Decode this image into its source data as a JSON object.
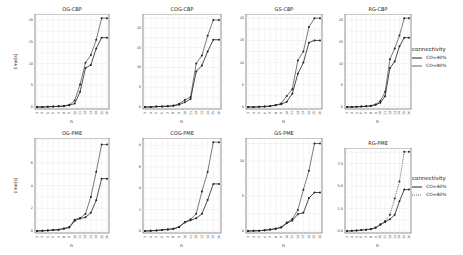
{
  "legend": {
    "title": "connectivity",
    "entries": [
      "CO=40%",
      "CO=80%"
    ]
  },
  "chart_data": [
    {
      "type": "line",
      "title": "OG-CBP",
      "xlabel": "n",
      "ylabel": "time(s)",
      "x": [
        3,
        4,
        5,
        6,
        7,
        8,
        9,
        10,
        11,
        12,
        13,
        14,
        15,
        16
      ],
      "ylim": [
        0,
        21
      ],
      "yticks": [
        0,
        5,
        10,
        15,
        20
      ],
      "grid": true,
      "series": [
        {
          "name": "CO=40%",
          "values": [
            0,
            0,
            0.05,
            0.1,
            0.15,
            0.2,
            0.4,
            0.8,
            3.5,
            9,
            9.7,
            13.5,
            16,
            16
          ]
        },
        {
          "name": "CO=80%",
          "values": [
            0,
            0,
            0.05,
            0.1,
            0.15,
            0.25,
            0.5,
            1.5,
            5.2,
            10.2,
            12,
            15.5,
            20.5,
            20.5
          ]
        }
      ]
    },
    {
      "type": "line",
      "title": "COG-CBP",
      "xlabel": "n",
      "ylabel": "",
      "x": [
        3,
        4,
        5,
        6,
        7,
        8,
        9,
        10,
        11,
        12,
        13,
        14,
        15,
        16
      ],
      "ylim": [
        0,
        23
      ],
      "yticks": [
        0,
        5,
        10,
        15,
        20
      ],
      "grid": true,
      "series": [
        {
          "name": "CO=40%",
          "values": [
            0,
            0,
            0.1,
            0.15,
            0.2,
            0.3,
            0.6,
            1.2,
            2,
            9,
            10.5,
            14,
            17,
            17
          ]
        },
        {
          "name": "CO=80%",
          "values": [
            0,
            0,
            0.1,
            0.15,
            0.2,
            0.35,
            0.8,
            1.8,
            2.5,
            11,
            13,
            18,
            22,
            22
          ]
        }
      ]
    },
    {
      "type": "line",
      "title": "GS-CBP",
      "xlabel": "n",
      "ylabel": "",
      "x": [
        3,
        4,
        5,
        6,
        7,
        8,
        9,
        10,
        11,
        12,
        13,
        14,
        15,
        16
      ],
      "ylim": [
        0,
        20.5
      ],
      "yticks": [
        0.0,
        5.0,
        10.0,
        15.0,
        20.0
      ],
      "grid": true,
      "series": [
        {
          "name": "CO=40%",
          "values": [
            0,
            0,
            0.05,
            0.1,
            0.2,
            0.4,
            0.6,
            1.2,
            3,
            7.5,
            10,
            14.5,
            15,
            15
          ]
        },
        {
          "name": "CO=80%",
          "values": [
            0,
            0,
            0.05,
            0.1,
            0.2,
            0.45,
            0.8,
            2.5,
            4,
            10.5,
            12.5,
            18,
            20,
            20
          ]
        }
      ]
    },
    {
      "type": "line",
      "title": "RG-CBP",
      "xlabel": "n",
      "ylabel": "",
      "x": [
        3,
        4,
        5,
        6,
        7,
        8,
        9,
        10,
        11,
        12,
        13,
        14,
        15,
        16
      ],
      "ylim": [
        0,
        21
      ],
      "yticks": [
        0,
        5,
        10,
        15,
        20
      ],
      "grid": true,
      "series": [
        {
          "name": "CO=40%",
          "values": [
            0,
            0,
            0.05,
            0.1,
            0.15,
            0.25,
            0.5,
            1,
            2.5,
            9,
            10.5,
            14,
            16,
            16
          ]
        },
        {
          "name": "CO=80%",
          "values": [
            0,
            0,
            0.05,
            0.1,
            0.15,
            0.3,
            0.6,
            1.4,
            3.5,
            11,
            13.5,
            16.5,
            20.5,
            20.5
          ]
        }
      ]
    },
    {
      "type": "line",
      "title": "OG-PME",
      "xlabel": "n",
      "ylabel": "time(s)",
      "x": [
        3,
        4,
        5,
        6,
        7,
        8,
        9,
        10,
        11,
        12,
        13,
        14,
        15,
        16
      ],
      "ylim": [
        0,
        8
      ],
      "yticks": [
        0,
        2,
        4,
        6
      ],
      "grid": true,
      "series": [
        {
          "name": "CO=40%",
          "values": [
            0,
            0.02,
            0.05,
            0.08,
            0.12,
            0.2,
            0.3,
            0.9,
            1.1,
            1.2,
            1.6,
            2.7,
            4.6,
            4.6
          ]
        },
        {
          "name": "CO=80%",
          "values": [
            0,
            0.02,
            0.05,
            0.08,
            0.12,
            0.22,
            0.35,
            1,
            1.15,
            1.5,
            3,
            5.2,
            7.6,
            7.6
          ]
        }
      ]
    },
    {
      "type": "line",
      "title": "COG-PME",
      "xlabel": "n",
      "ylabel": "",
      "x": [
        3,
        4,
        5,
        6,
        7,
        8,
        9,
        10,
        11,
        12,
        13,
        14,
        15,
        16
      ],
      "ylim": [
        0,
        8.5
      ],
      "yticks": [
        0,
        2,
        4,
        6,
        8
      ],
      "grid": true,
      "series": [
        {
          "name": "CO=40%",
          "values": [
            0,
            0.02,
            0.05,
            0.1,
            0.15,
            0.2,
            0.35,
            0.8,
            1,
            1.2,
            1.6,
            2.9,
            4.4,
            4.4
          ]
        },
        {
          "name": "CO=80%",
          "values": [
            0,
            0.02,
            0.05,
            0.1,
            0.15,
            0.22,
            0.4,
            0.85,
            1.1,
            1.6,
            3.7,
            5.5,
            8.3,
            8.3
          ]
        }
      ]
    },
    {
      "type": "line",
      "title": "GS-PME",
      "xlabel": "n",
      "ylabel": "",
      "x": [
        3,
        4,
        5,
        6,
        7,
        8,
        9,
        10,
        11,
        12,
        13,
        14,
        15,
        16
      ],
      "ylim": [
        0,
        13
      ],
      "yticks": [
        0,
        5,
        10
      ],
      "grid": true,
      "series": [
        {
          "name": "CO=40%",
          "values": [
            0,
            0.02,
            0.05,
            0.1,
            0.2,
            0.3,
            0.5,
            1.1,
            1.5,
            2.4,
            2.6,
            4.7,
            5.5,
            5.5
          ]
        },
        {
          "name": "CO=80%",
          "values": [
            0,
            0.02,
            0.05,
            0.1,
            0.2,
            0.35,
            0.55,
            1.2,
            1.7,
            3,
            5.9,
            8.6,
            12.5,
            12.5
          ]
        }
      ]
    },
    {
      "type": "line",
      "title": "RG-PME",
      "xlabel": "n",
      "ylabel": "",
      "x": [
        3,
        4,
        5,
        6,
        7,
        8,
        9,
        10,
        11,
        12,
        13,
        14,
        15,
        16
      ],
      "ylim": [
        0,
        9
      ],
      "yticks": [
        0.0,
        2.5,
        5.0,
        7.5
      ],
      "grid": true,
      "series": [
        {
          "name": "CO=40%",
          "values": [
            0,
            0.02,
            0.05,
            0.1,
            0.15,
            0.2,
            0.35,
            0.7,
            1,
            1.3,
            1.8,
            3.3,
            4.6,
            4.6
          ]
        },
        {
          "name": "CO=80%",
          "values": [
            0,
            0.02,
            0.05,
            0.1,
            0.15,
            0.22,
            0.4,
            0.75,
            1.1,
            1.8,
            3.6,
            5.5,
            8.8,
            8.8
          ]
        }
      ]
    }
  ]
}
